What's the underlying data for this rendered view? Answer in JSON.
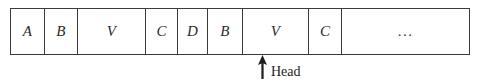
{
  "diagram": {
    "type": "tape-diagram",
    "title": "",
    "tape": {
      "cells": [
        {
          "label": "A",
          "width": 34
        },
        {
          "label": "B",
          "width": 33
        },
        {
          "label": "V",
          "width": 68
        },
        {
          "label": "C",
          "width": 32
        },
        {
          "label": "D",
          "width": 30
        },
        {
          "label": "B",
          "width": 35
        },
        {
          "label": "V",
          "width": 66
        },
        {
          "label": "C",
          "width": 33
        },
        {
          "label": "...",
          "width": 127
        }
      ]
    },
    "pointer": {
      "label": "Head",
      "points_to_cell_index": 6,
      "arrow_direction": "up",
      "icon": "arrow-up-icon"
    },
    "colors": {
      "border": "#3a3a3a",
      "text": "#2b2b2b",
      "label_text": "#1c1c1c",
      "background": "#ffffff"
    }
  }
}
